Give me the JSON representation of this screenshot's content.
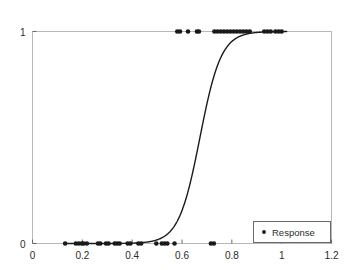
{
  "chart_data": {
    "type": "scatter",
    "title": "Response vs Ad spend",
    "xlabel": "",
    "ylabel": "",
    "xlim": [
      0,
      1.2
    ],
    "ylim": [
      0,
      1
    ],
    "grid": false,
    "xticks": [
      0,
      0.2,
      0.4,
      0.6,
      0.8,
      1,
      1.2
    ],
    "xtick_labels": [
      "0",
      "0.2",
      "0.4",
      "0.6",
      "0.8",
      "1",
      "1.2"
    ],
    "yticks": [
      0,
      1
    ],
    "ytick_labels": [
      "0",
      "1"
    ],
    "legend": {
      "position": "lower right",
      "entries": [
        {
          "label": "Response",
          "marker": "dot",
          "color": "#1a1a1a"
        }
      ]
    },
    "series": [
      {
        "name": "Response",
        "type": "scatter",
        "marker": "dot",
        "color": "#1a1a1a",
        "x": [
          0.131,
          0.174,
          0.186,
          0.198,
          0.205,
          0.218,
          0.263,
          0.272,
          0.295,
          0.305,
          0.33,
          0.34,
          0.35,
          0.382,
          0.393,
          0.425,
          0.436,
          0.497,
          0.519,
          0.53,
          0.541,
          0.57,
          0.716,
          0.728,
          0.581,
          0.592,
          0.624,
          0.66,
          0.668,
          0.73,
          0.742,
          0.755,
          0.768,
          0.781,
          0.794,
          0.807,
          0.82,
          0.833,
          0.846,
          0.859,
          0.872,
          0.93,
          0.943,
          0.956,
          0.975,
          0.988,
          1.0
        ],
        "y": [
          0,
          0,
          0,
          0,
          0,
          0,
          0,
          0,
          0,
          0,
          0,
          0,
          0,
          0,
          0,
          0,
          0,
          0,
          0,
          0,
          0,
          0,
          0,
          0,
          1,
          1,
          1,
          1,
          1,
          1,
          1,
          1,
          1,
          1,
          1,
          1,
          1,
          1,
          1,
          1,
          1,
          1,
          1,
          1,
          1,
          1,
          1
        ]
      },
      {
        "name": "Fitted logistic curve",
        "type": "line",
        "color": "#1a1a1a",
        "x_start": 0.13,
        "x_end": 1.02,
        "midpoint": 0.672,
        "steepness": 23.5
      }
    ]
  }
}
